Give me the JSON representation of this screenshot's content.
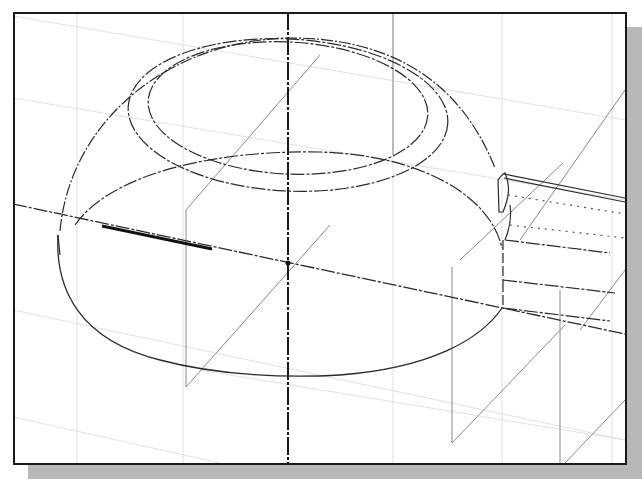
{
  "viewport": {
    "type": "cad-wireframe-isometric",
    "subject": "dome-shaped bowl with rectangular handle extrusion",
    "frame_color": "#1a1a1a",
    "shadow_color": "#b8b8b8",
    "grid_color": "#dcdcdc",
    "line_color": "#2a2a2a",
    "construction_color": "#8a8a8a",
    "labels": []
  }
}
